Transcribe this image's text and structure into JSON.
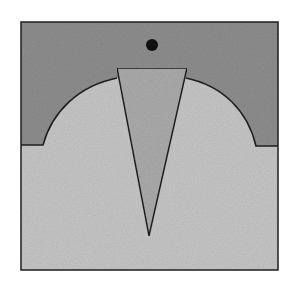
{
  "diagram": {
    "type": "geometric-illustration",
    "colors": {
      "background": "#ffffff",
      "upper_region": "#8e8e8e",
      "lower_region": "#c4c4c4",
      "wedge": "#ababab",
      "outline": "#1e1e1e",
      "dot": "#111111"
    },
    "elements": [
      "outer-square",
      "dark-upper-region",
      "light-dome-region",
      "triangular-wedge",
      "black-dot"
    ]
  }
}
